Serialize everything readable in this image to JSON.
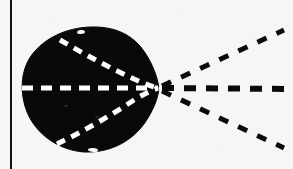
{
  "figure": {
    "domain": "diagram",
    "kind": "scanned-schematic-illustration",
    "caption": "",
    "title": "",
    "canvas": {
      "width": 293,
      "height": 169,
      "background_color": "#f7f6f4",
      "ink_color": "#0a0a0a",
      "highlight_color": "#ffffff"
    },
    "border_rule": {
      "name": "left-vertical-rule",
      "orientation": "vertical",
      "x": 11,
      "y_start": 0,
      "y_end": 169,
      "stroke_width": 2,
      "color": "#111111"
    },
    "blob": {
      "name": "solid-black-blob",
      "shape_description": "rounded egg / teardrop outline, broad at the left, tapering to a point at the right",
      "fill_color": "#090909",
      "bounds": {
        "left": 22,
        "top": 28,
        "right": 159,
        "bottom": 152
      },
      "apex_point": {
        "x": 159,
        "y": 88
      },
      "center": {
        "x": 88,
        "y": 90
      },
      "width": 137,
      "height": 124,
      "outline_path": "M 159,88 C 157,74 150,58 140,46 C 128,32 110,26 90,27 C 66,28 44,38 31,56 C 20,72 20,94 27,112 C 36,134 58,150 84,152 C 108,153 130,143 144,124 C 153,111 158,99 159,88 Z"
    },
    "inner_dashed_lines": [
      {
        "name": "inner-dash-upper",
        "color": "#ffffff",
        "stroke_width": 5,
        "dash_pattern": "9 7",
        "path": "M 60,40 C 84,54 110,68 134,79 C 145,84 153,87 158,88",
        "from": {
          "x": 60,
          "y": 40
        },
        "to": {
          "x": 158,
          "y": 88
        }
      },
      {
        "name": "inner-dash-middle",
        "color": "#ffffff",
        "stroke_width": 5,
        "dash_pattern": "11 8",
        "path": "M 22,88 L 158,88",
        "from": {
          "x": 22,
          "y": 88
        },
        "to": {
          "x": 158,
          "y": 88
        }
      },
      {
        "name": "inner-dash-lower",
        "color": "#ffffff",
        "stroke_width": 5,
        "dash_pattern": "9 7",
        "path": "M 57,144 C 82,132 110,116 134,100 C 145,93 153,90 158,88",
        "from": {
          "x": 57,
          "y": 144
        },
        "to": {
          "x": 158,
          "y": 88
        }
      }
    ],
    "convergence_point": {
      "name": "ray-convergence-point",
      "x": 160,
      "y": 88,
      "description": "apex of the blob where all inner dashed lines and all outer dashed rays meet"
    },
    "outer_dashed_rays": [
      {
        "name": "ray-upper",
        "color": "#0a0a0a",
        "stroke_width": 5,
        "dash_pattern": "10 11",
        "from": {
          "x": 162,
          "y": 86
        },
        "to": {
          "x": 284,
          "y": 30
        },
        "angle_deg": -24.6
      },
      {
        "name": "ray-middle",
        "color": "#0a0a0a",
        "stroke_width": 6,
        "dash_pattern": "12 10",
        "from": {
          "x": 162,
          "y": 88
        },
        "to": {
          "x": 293,
          "y": 89
        },
        "angle_deg": 0.4
      },
      {
        "name": "ray-lower",
        "color": "#0a0a0a",
        "stroke_width": 5,
        "dash_pattern": "10 11",
        "from": {
          "x": 162,
          "y": 91
        },
        "to": {
          "x": 284,
          "y": 148
        },
        "angle_deg": 25.0
      }
    ],
    "blob_notches": [
      {
        "name": "notch-top-left",
        "x": 52,
        "y": 33,
        "rx": 5,
        "ry": 3,
        "rotate": -24
      },
      {
        "name": "notch-top-mid",
        "x": 81,
        "y": 32,
        "rx": 4,
        "ry": 2,
        "rotate": -8
      },
      {
        "name": "notch-bottom-left",
        "x": 49,
        "y": 148,
        "rx": 5,
        "ry": 3,
        "rotate": 18
      },
      {
        "name": "notch-bottom-mid",
        "x": 93,
        "y": 150,
        "rx": 5,
        "ry": 2,
        "rotate": 5
      },
      {
        "name": "speck-interior-a",
        "x": 66,
        "y": 106,
        "rx": 2,
        "ry": 1,
        "rotate": 0
      },
      {
        "name": "speck-interior-b",
        "x": 97,
        "y": 117,
        "rx": 2,
        "ry": 1,
        "rotate": 0
      }
    ]
  }
}
